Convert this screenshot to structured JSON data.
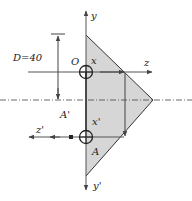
{
  "diagram": {
    "type": "mechanics-cross-section",
    "labels": {
      "dimension": "D=40",
      "origin": "O",
      "x_axis": "x",
      "y_axis": "y",
      "z_axis": "z",
      "x_prime": "x'",
      "y_prime": "y'",
      "z_prime": "z'",
      "point_a": "A",
      "point_a_prime": "A'"
    },
    "colors": {
      "fill": "#d6d6d6",
      "line": "#333333",
      "axis": "#555555"
    }
  }
}
